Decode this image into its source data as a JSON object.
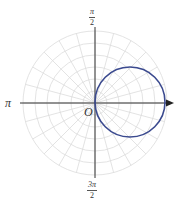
{
  "diagram": {
    "type": "polar-graph",
    "origin_px": [
      95,
      103
    ],
    "grid": {
      "circles": 6,
      "circle_spacing_px": 12,
      "radial_step_deg": 15,
      "color": "#dcdcdc"
    },
    "axes": {
      "color": "#333333",
      "polar_axis_arrow": true
    },
    "labels": {
      "top_num": "π",
      "top_den": "2",
      "left": "π",
      "origin": "O",
      "bottom_num": "3π",
      "bottom_den": "2"
    },
    "curve": {
      "shape": "circle",
      "description": "circle through the pole, symmetric about the polar axis (r = a·cos θ)",
      "center_px": [
        130,
        102
      ],
      "radius_px": 35,
      "color": "#3b4a8f"
    }
  }
}
